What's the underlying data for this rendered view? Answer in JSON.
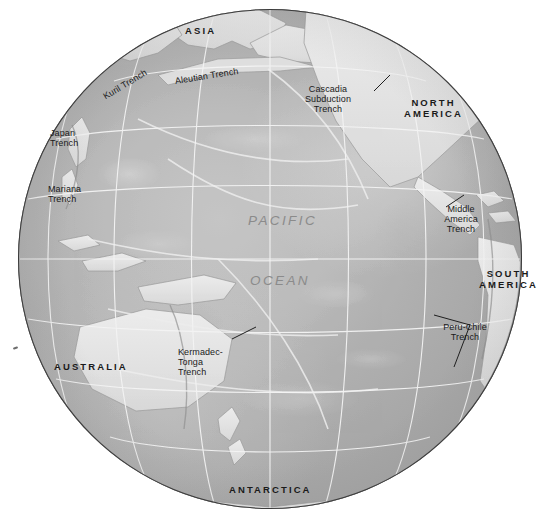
{
  "map": {
    "title": "Pacific Ocean Basin – Subduction Trenches",
    "projection": "orthographic-globe",
    "background_color": "#ffffff",
    "ocean_fill": "#b8b8b8",
    "land_fill": "#e3e3e3",
    "graticule_color": "#f2f2f2",
    "rim_color": "#3b3b3b",
    "label_color": "#1a1a1a",
    "ocean_label_color": "#8b8b8b"
  },
  "ocean_labels": [
    {
      "text": "PACIFIC",
      "x": 248,
      "y": 221
    },
    {
      "text": "OCEAN",
      "x": 250,
      "y": 281
    }
  ],
  "continents": [
    {
      "text": "ASIA",
      "x": 185,
      "y": 31
    },
    {
      "text": "NORTH AMERICA",
      "line1": "NORTH",
      "line2": "AMERICA",
      "x": 410,
      "y": 103
    },
    {
      "text": "SOUTH AMERICA",
      "line1": "SOUTH",
      "line2": "AMERICA",
      "x": 482,
      "y": 274
    },
    {
      "text": "AUSTRALIA",
      "x": 54,
      "y": 362
    },
    {
      "text": "ANTARCTICA",
      "x": 229,
      "y": 485
    }
  ],
  "trenches": [
    {
      "name": "Kuril Trench",
      "lines": [
        "Kuril Trench"
      ],
      "x": 104,
      "y": 96,
      "rotate": -31
    },
    {
      "name": "Aleutian Trench",
      "lines": [
        "Aleutian Trench"
      ],
      "x": 175,
      "y": 80,
      "rotate": -9
    },
    {
      "name": "Cascadia Subduction Trench",
      "lines": [
        "Cascadia",
        "Subduction",
        "Trench"
      ],
      "x": 290,
      "y": 87,
      "rotate": 0
    },
    {
      "name": "Japan Trench",
      "lines": [
        "Japan",
        "Trench"
      ],
      "x": 50,
      "y": 130,
      "rotate": 0
    },
    {
      "name": "Mariana Trench",
      "lines": [
        "Mariana",
        "Trench"
      ],
      "x": 48,
      "y": 186,
      "rotate": 0
    },
    {
      "name": "Middle America Trench",
      "lines": [
        "Middle",
        "America",
        "Trench"
      ],
      "x": 434,
      "y": 206,
      "rotate": 0
    },
    {
      "name": "Peru-Chile Trench",
      "lines": [
        "Peru-Chile",
        "Trench"
      ],
      "x": 440,
      "y": 324,
      "rotate": 0
    },
    {
      "name": "Kermadec-Tonga Trench",
      "lines": [
        "Kermadec-",
        "Tonga",
        "Trench"
      ],
      "x": 178,
      "y": 349,
      "rotate": 0
    }
  ]
}
